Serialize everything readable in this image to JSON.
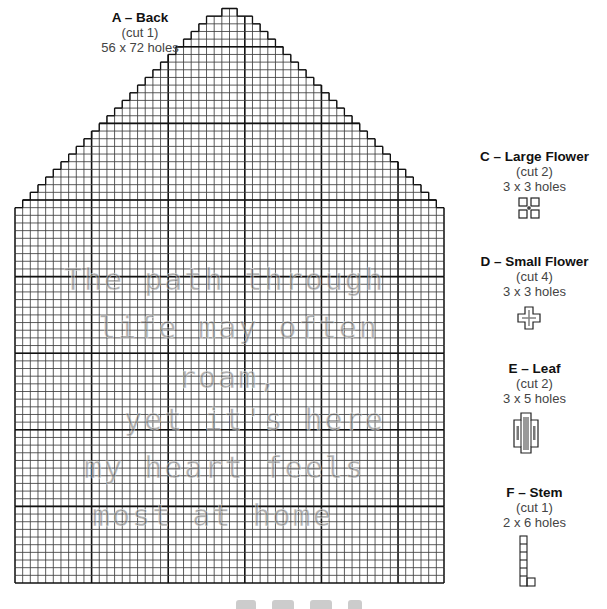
{
  "pieces": {
    "A": {
      "title": "A – Back",
      "cut": "(cut 1)",
      "size": "56 x 72 holes"
    },
    "C": {
      "title": "C – Large Flower",
      "cut": "(cut 2)",
      "size": "3 x 3 holes"
    },
    "D": {
      "title": "D – Small Flower",
      "cut": "(cut 4)",
      "size": "3 x 3 holes"
    },
    "E": {
      "title": "E – Leaf",
      "cut": "(cut 2)",
      "size": "3 x 5 holes"
    },
    "F": {
      "title": "F – Stem",
      "cut": "(cut 1)",
      "size": "2 x 6 holes"
    }
  },
  "stitched_text": [
    "The path through",
    "life may often",
    "roam,",
    "yet it's here",
    "my heart feels",
    "most at home"
  ],
  "colors": {
    "grid_line": "#333333",
    "major_line": "#111111",
    "stitch": "#8a8a8a"
  }
}
